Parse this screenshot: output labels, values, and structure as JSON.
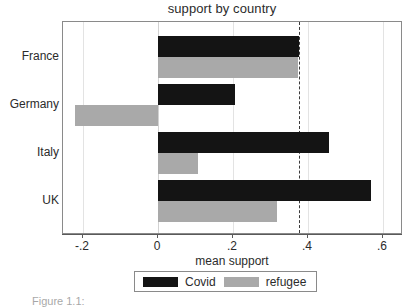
{
  "chart_data": {
    "type": "bar",
    "orientation": "horizontal",
    "title": "support by country",
    "xlabel": "mean support",
    "ylabel": "",
    "categories": [
      "France",
      "Germany",
      "Italy",
      "UK"
    ],
    "series": [
      {
        "name": "Covid",
        "color": "#141414",
        "values": [
          0.375,
          0.205,
          0.456,
          0.568
        ]
      },
      {
        "name": "refugee",
        "color": "#a9a9a9",
        "values": [
          0.373,
          -0.221,
          0.107,
          0.317
        ]
      }
    ],
    "xlim": [
      -0.27,
      0.62
    ],
    "xticks": [
      -0.2,
      0,
      0.2,
      0.4,
      0.6
    ],
    "xtick_labels": [
      "-.2",
      "0",
      ".2",
      ".4",
      ".6"
    ],
    "grid": true,
    "reference_line": {
      "value": 0.375,
      "style": "dashed",
      "color": "#3a3a3a"
    },
    "legend": {
      "position": "bottom",
      "entries": [
        "Covid",
        "refugee"
      ]
    }
  },
  "caption": {
    "text": "Figure 1.1: "
  }
}
